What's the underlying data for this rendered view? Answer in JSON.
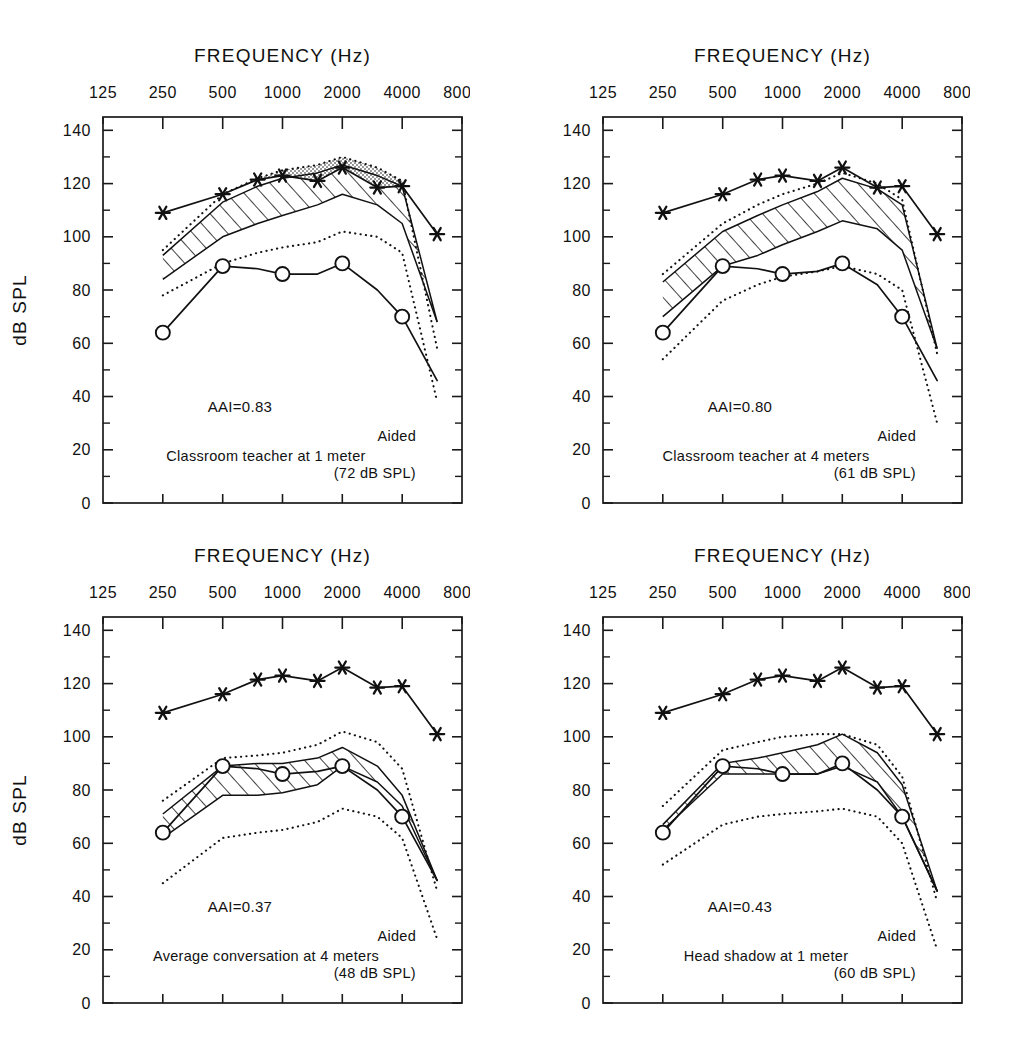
{
  "figure": {
    "axis_title": "FREQUENCY (Hz)",
    "y_axis_label": "dB SPL",
    "x_tick_labels": [
      "125",
      "250",
      "500",
      "1000",
      "2000",
      "4000",
      "8000"
    ],
    "y_tick_labels": [
      "0",
      "20",
      "40",
      "60",
      "80",
      "100",
      "120",
      "140"
    ],
    "colors": {
      "ink": "#111111",
      "frame": "#1a1a1a",
      "stipple": "#8a8a8a",
      "background": "#ffffff"
    }
  },
  "chart_data": [
    {
      "type": "line",
      "panel_index": 1,
      "title": "",
      "xlabel": "FREQUENCY (Hz)",
      "ylabel": "dB SPL",
      "xlim": [
        125,
        8000
      ],
      "ylim": [
        0,
        145
      ],
      "x_log_scale": true,
      "grid": false,
      "legend_position": "none",
      "x": [
        250,
        500,
        750,
        1000,
        1500,
        2000,
        3000,
        4000,
        6000
      ],
      "annotations": {
        "aai": "AAI=0.83",
        "condition": "Classroom teacher at 1 meter",
        "level": "(72 dB SPL)",
        "aided": "Aided"
      },
      "series": [
        {
          "name": "Saturation response (star markers)",
          "marker": "star",
          "style": "solid",
          "values": [
            109,
            116,
            121.5,
            123,
            121,
            126,
            118.5,
            119,
            101
          ]
        },
        {
          "name": "Aided threshold (circle markers)",
          "marker": "circle",
          "style": "solid",
          "values": [
            64,
            89,
            88,
            86,
            86,
            90,
            80,
            70,
            46
          ]
        },
        {
          "name": "Speech band upper (LTASS +)",
          "marker": "none",
          "style": "solid",
          "values": [
            93,
            113,
            119,
            122,
            124,
            127,
            123,
            119,
            68
          ]
        },
        {
          "name": "Speech band lower (LTASS -)",
          "marker": "none",
          "style": "solid",
          "values": [
            84,
            100,
            105,
            108,
            112,
            116,
            112,
            105,
            68
          ]
        },
        {
          "name": "Upper envelope (dotted)",
          "marker": "none",
          "style": "dotted",
          "values": [
            95,
            116,
            122,
            125,
            127,
            130,
            126,
            121,
            58
          ]
        },
        {
          "name": "Lower envelope (dotted)",
          "marker": "none",
          "style": "dotted",
          "values": [
            78,
            90,
            94,
            96,
            98,
            102,
            100,
            94,
            38
          ]
        }
      ]
    },
    {
      "type": "line",
      "panel_index": 2,
      "title": "",
      "xlabel": "FREQUENCY (Hz)",
      "ylabel": "dB SPL",
      "xlim": [
        125,
        8000
      ],
      "ylim": [
        0,
        145
      ],
      "x_log_scale": true,
      "grid": false,
      "legend_position": "none",
      "x": [
        250,
        500,
        750,
        1000,
        1500,
        2000,
        3000,
        4000,
        6000
      ],
      "annotations": {
        "aai": "AAI=0.80",
        "condition": "Classroom teacher at 4 meters",
        "level": "(61 dB SPL)",
        "aided": "Aided"
      },
      "series": [
        {
          "name": "Saturation response (star markers)",
          "marker": "star",
          "style": "solid",
          "values": [
            109,
            116,
            121.5,
            123,
            121,
            126,
            118.5,
            119,
            101
          ]
        },
        {
          "name": "Aided threshold (circle markers)",
          "marker": "circle",
          "style": "solid",
          "values": [
            64,
            89,
            88,
            86,
            87,
            90,
            82,
            70,
            46
          ]
        },
        {
          "name": "Speech band upper (LTASS +)",
          "marker": "none",
          "style": "solid",
          "values": [
            83,
            102,
            108,
            112,
            117,
            122,
            118,
            112,
            58
          ]
        },
        {
          "name": "Speech band lower (LTASS -)",
          "marker": "none",
          "style": "solid",
          "values": [
            70,
            89,
            93,
            97,
            102,
            106,
            103,
            95,
            58
          ]
        },
        {
          "name": "Upper envelope (dotted)",
          "marker": "none",
          "style": "dotted",
          "values": [
            86,
            105,
            112,
            116,
            120,
            124,
            120,
            114,
            56
          ]
        },
        {
          "name": "Lower envelope (dotted)",
          "marker": "none",
          "style": "dotted",
          "values": [
            54,
            76,
            82,
            85,
            87,
            89,
            86,
            80,
            30
          ]
        }
      ]
    },
    {
      "type": "line",
      "panel_index": 3,
      "title": "",
      "xlabel": "FREQUENCY (Hz)",
      "ylabel": "dB SPL",
      "xlim": [
        125,
        8000
      ],
      "ylim": [
        0,
        145
      ],
      "x_log_scale": true,
      "grid": false,
      "legend_position": "none",
      "x": [
        250,
        500,
        750,
        1000,
        1500,
        2000,
        3000,
        4000,
        6000
      ],
      "annotations": {
        "aai": "AAI=0.37",
        "condition": "Average conversation at 4 meters",
        "level": "(48 dB SPL)",
        "aided": "Aided"
      },
      "series": [
        {
          "name": "Saturation response (star markers)",
          "marker": "star",
          "style": "solid",
          "values": [
            109,
            116,
            121.5,
            123,
            121,
            126,
            118.5,
            119,
            101
          ]
        },
        {
          "name": "Aided threshold (circle markers)",
          "marker": "circle",
          "style": "solid",
          "values": [
            64,
            89,
            88,
            86,
            87,
            89,
            80,
            70,
            46
          ]
        },
        {
          "name": "Speech band upper (LTASS +)",
          "marker": "none",
          "style": "solid",
          "values": [
            71,
            89,
            90,
            90,
            92,
            96,
            89,
            78,
            46
          ]
        },
        {
          "name": "Speech band lower (LTASS -)",
          "marker": "none",
          "style": "solid",
          "values": [
            62,
            78,
            78,
            79,
            82,
            89,
            83,
            74,
            46
          ]
        },
        {
          "name": "Upper envelope (dotted)",
          "marker": "none",
          "style": "dotted",
          "values": [
            76,
            92,
            93,
            94,
            97,
            102,
            98,
            88,
            42
          ]
        },
        {
          "name": "Lower envelope (dotted)",
          "marker": "none",
          "style": "dotted",
          "values": [
            45,
            62,
            64,
            65,
            68,
            73,
            70,
            62,
            24
          ]
        }
      ]
    },
    {
      "type": "line",
      "panel_index": 4,
      "title": "",
      "xlabel": "FREQUENCY (Hz)",
      "ylabel": "dB SPL",
      "xlim": [
        125,
        8000
      ],
      "ylim": [
        0,
        145
      ],
      "x_log_scale": true,
      "grid": false,
      "legend_position": "none",
      "x": [
        250,
        500,
        750,
        1000,
        1500,
        2000,
        3000,
        4000,
        6000
      ],
      "annotations": {
        "aai": "AAI=0.43",
        "condition": "Head shadow at 1 meter",
        "level": "(60 dB SPL)",
        "aided": "Aided"
      },
      "series": [
        {
          "name": "Saturation response (star markers)",
          "marker": "star",
          "style": "solid",
          "values": [
            109,
            116,
            121.5,
            123,
            121,
            126,
            118.5,
            119,
            101
          ]
        },
        {
          "name": "Aided threshold (circle markers)",
          "marker": "circle",
          "style": "solid",
          "values": [
            64,
            89,
            88,
            86,
            86,
            90,
            80,
            70,
            42
          ]
        },
        {
          "name": "Speech band upper (LTASS +)",
          "marker": "none",
          "style": "solid",
          "values": [
            67,
            90,
            92,
            94,
            97,
            101,
            94,
            82,
            42
          ]
        },
        {
          "name": "Speech band lower (LTASS -)",
          "marker": "none",
          "style": "solid",
          "values": [
            65,
            86,
            86,
            86,
            86,
            89,
            83,
            70,
            42
          ]
        },
        {
          "name": "Upper envelope (dotted)",
          "marker": "none",
          "style": "dotted",
          "values": [
            74,
            95,
            98,
            100,
            101,
            101,
            97,
            85,
            38
          ]
        },
        {
          "name": "Lower envelope (dotted)",
          "marker": "none",
          "style": "dotted",
          "values": [
            52,
            67,
            70,
            71,
            72,
            73,
            70,
            60,
            20
          ]
        }
      ]
    }
  ]
}
